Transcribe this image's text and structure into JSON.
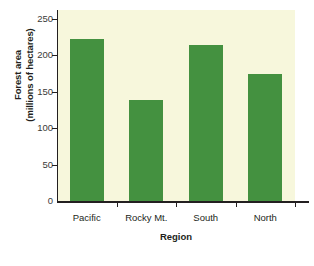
{
  "chart_data": {
    "type": "bar",
    "title": "",
    "xlabel": "Region",
    "ylabel": "Forest area (millions of hectares)",
    "ylabel_line1": "Forest area",
    "ylabel_line2": "(millions of hectares)",
    "categories": [
      "Pacific",
      "Rocky Mt.",
      "South",
      "North"
    ],
    "values": [
      222,
      138,
      214,
      174
    ],
    "ylim": [
      0,
      262
    ],
    "yticks": [
      0,
      50,
      100,
      150,
      200,
      250
    ],
    "ytick_labels": [
      "0",
      "50",
      "100",
      "150",
      "200",
      "250"
    ],
    "grid": false,
    "legend": "none",
    "series_color": "#449140",
    "plot_background": "#f7f7dc",
    "axis_color": "#231f20"
  }
}
